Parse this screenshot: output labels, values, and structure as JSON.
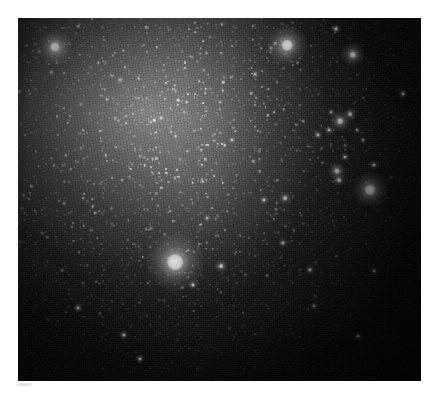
{
  "figure": {
    "caption": "",
    "colormap": "grayscale",
    "frame": {
      "x": 18,
      "y": 18,
      "width": 403,
      "height": 363,
      "background_color": "#050505",
      "page_background_color": "#ffffff",
      "border": "none"
    }
  },
  "chart_data": {
    "type": "scatter",
    "subtitle": "",
    "xlabel": "",
    "ylabel": "",
    "xlim": [
      0,
      403
    ],
    "ylim": [
      0,
      363
    ],
    "grid": false,
    "legend": "none",
    "units": "pixels within image frame",
    "annotations": [],
    "background": {
      "description": "Diffuse unresolved galaxy light, brightest toward upper-left of centre, fading to dark at right and bottom edges",
      "peak_brightness_position": [
        137,
        109
      ],
      "peak_gray_level": 152,
      "edge_gray_level": 8,
      "noise": "photon + read noise speckle"
    },
    "series": [
      {
        "name": "bright foreground / supergiant stars",
        "points": [
          {
            "x": 157,
            "y": 244,
            "size": 22,
            "peak": 255,
            "label": "dominant bright star"
          },
          {
            "x": 269,
            "y": 27,
            "size": 15,
            "peak": 255,
            "label": "bright star upper centre-right"
          },
          {
            "x": 37,
            "y": 29,
            "size": 13,
            "peak": 250,
            "label": "bright star upper left"
          },
          {
            "x": 352,
            "y": 172,
            "size": 14,
            "peak": 252,
            "label": "bright star right"
          },
          {
            "x": 335,
            "y": 37,
            "size": 9,
            "peak": 235,
            "label": "star upper right"
          }
        ]
      },
      {
        "name": "star cluster / association (upper right)",
        "points": [
          {
            "x": 322,
            "y": 103,
            "size": 8,
            "peak": 240
          },
          {
            "x": 332,
            "y": 96,
            "size": 5,
            "peak": 215
          },
          {
            "x": 311,
            "y": 112,
            "size": 4,
            "peak": 200
          },
          {
            "x": 300,
            "y": 117,
            "size": 4,
            "peak": 195
          },
          {
            "x": 339,
            "y": 112,
            "size": 3,
            "peak": 180
          },
          {
            "x": 313,
            "y": 94,
            "size": 3,
            "peak": 175
          },
          {
            "x": 327,
            "y": 139,
            "size": 4,
            "peak": 195
          },
          {
            "x": 319,
            "y": 153,
            "size": 7,
            "peak": 230
          },
          {
            "x": 321,
            "y": 162,
            "size": 5,
            "peak": 210
          },
          {
            "x": 345,
            "y": 122,
            "size": 3,
            "peak": 170
          }
        ]
      },
      {
        "name": "moderately bright resolved stars",
        "points": [
          {
            "x": 203,
            "y": 248,
            "size": 5,
            "peak": 210
          },
          {
            "x": 175,
            "y": 267,
            "size": 4,
            "peak": 195
          },
          {
            "x": 246,
            "y": 182,
            "size": 4,
            "peak": 200
          },
          {
            "x": 267,
            "y": 180,
            "size": 5,
            "peak": 205
          },
          {
            "x": 292,
            "y": 252,
            "size": 4,
            "peak": 195
          },
          {
            "x": 265,
            "y": 225,
            "size": 4,
            "peak": 190
          },
          {
            "x": 356,
            "y": 147,
            "size": 4,
            "peak": 195
          },
          {
            "x": 385,
            "y": 76,
            "size": 4,
            "peak": 190
          },
          {
            "x": 318,
            "y": 11,
            "size": 4,
            "peak": 195
          },
          {
            "x": 106,
            "y": 317,
            "size": 4,
            "peak": 195
          },
          {
            "x": 122,
            "y": 341,
            "size": 4,
            "peak": 190
          },
          {
            "x": 60,
            "y": 290,
            "size": 4,
            "peak": 185
          },
          {
            "x": 143,
            "y": 100,
            "size": 3,
            "peak": 180
          },
          {
            "x": 102,
            "y": 62,
            "size": 3,
            "peak": 178
          },
          {
            "x": 214,
            "y": 122,
            "size": 3,
            "peak": 176
          },
          {
            "x": 237,
            "y": 56,
            "size": 3,
            "peak": 180
          },
          {
            "x": 189,
            "y": 200,
            "size": 3,
            "peak": 175
          },
          {
            "x": 296,
            "y": 288,
            "size": 3,
            "peak": 172
          },
          {
            "x": 356,
            "y": 253,
            "size": 3,
            "peak": 170
          },
          {
            "x": 340,
            "y": 318,
            "size": 3,
            "peak": 168
          }
        ]
      }
    ]
  }
}
